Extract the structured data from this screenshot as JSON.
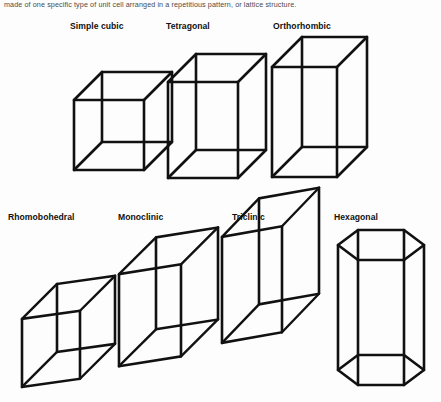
{
  "page": {
    "background_color": "#fdfdfd",
    "stroke_color": "#111111",
    "caption_color": "#4b4b4b"
  },
  "caption": {
    "text": "made of one specific type of unit cell arranged in a repetitious pattern, or lattice structure."
  },
  "figure": {
    "rows": [
      {
        "row_index": 1,
        "items": [
          {
            "label": "Simple cubic",
            "label_x": 70,
            "label_y": 21,
            "shape": "cube",
            "description": "equal-sided wireframe cube"
          },
          {
            "label": "Tetragonal",
            "label_x": 166,
            "label_y": 21,
            "shape": "rectangular-prism",
            "description": "square base, taller vertical axis"
          },
          {
            "label": "Orthorhombic",
            "label_x": 273,
            "label_y": 21,
            "shape": "rectangular-prism",
            "description": "three unequal axes, all right angles"
          }
        ]
      },
      {
        "row_index": 2,
        "items": [
          {
            "label": "Rhomobohedral",
            "label_x": 8,
            "label_y": 212,
            "shape": "sheared-cube",
            "description": "skewed cube, equal edges, oblique angles"
          },
          {
            "label": "Monoclinic",
            "label_x": 118,
            "label_y": 212,
            "shape": "sheared-prism",
            "description": "slanted prism, one oblique angle"
          },
          {
            "label": "Triclinic",
            "label_x": 232,
            "label_y": 212,
            "shape": "sheared-prism",
            "description": "slanted prism, all angles oblique"
          },
          {
            "label": "Hexagonal",
            "label_x": 334,
            "label_y": 212,
            "shape": "hexagonal-prism",
            "description": "hexagonal top and bottom faces"
          }
        ]
      }
    ]
  }
}
